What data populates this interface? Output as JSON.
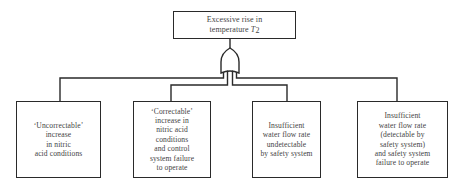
{
  "diagram": {
    "type": "fault-tree",
    "top_event": {
      "text_prefix": "Excessive rise in\ntemperature ",
      "symbol": "T",
      "subscript": "2"
    },
    "gate": {
      "type": "OR",
      "icon": "or-gate-icon"
    },
    "events": [
      {
        "id": "e1",
        "label": "‘Uncorrectable’\nincrease\nin nitric\nacid conditions"
      },
      {
        "id": "e2",
        "label": "‘Correctable’\nincrease in\nnitric acid\nconditions\nand control\nsystem failure\nto operate"
      },
      {
        "id": "e3",
        "label": "Insufficient\nwater flow rate\nundetectable\nby safety system"
      },
      {
        "id": "e4",
        "label": "Insufficient\nwater flow rate\n(detectable by\nsafety system)\nand safety system\nfailure to operate"
      }
    ],
    "colors": {
      "line": "#2a2a2a",
      "text": "#444444",
      "background": "#ffffff"
    }
  }
}
